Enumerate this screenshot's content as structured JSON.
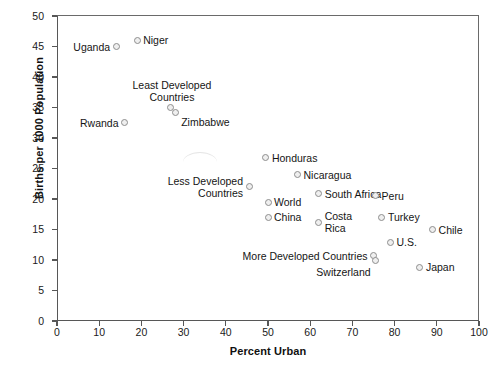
{
  "chart_data": {
    "type": "scatter",
    "title": "",
    "xlabel": "Percent Urban",
    "ylabel": "Births per 1000 Population",
    "xlim": [
      0,
      100
    ],
    "ylim": [
      0,
      50
    ],
    "xticks": [
      0,
      10,
      20,
      30,
      40,
      50,
      60,
      70,
      80,
      90,
      100
    ],
    "yticks": [
      0,
      5,
      10,
      15,
      20,
      25,
      30,
      35,
      40,
      45,
      50
    ],
    "grid": false,
    "legend": "none",
    "points": [
      {
        "label": "Uganda",
        "x": 14,
        "y": 45.0,
        "label_pos": "left"
      },
      {
        "label": "Niger",
        "x": 19,
        "y": 46.0,
        "label_pos": "right"
      },
      {
        "label": "Rwanda",
        "x": 16,
        "y": 32.5,
        "label_pos": "left"
      },
      {
        "label": "Least Developed\nCountries",
        "x": 27,
        "y": 35.0,
        "label_pos": "above"
      },
      {
        "label": "Zimbabwe",
        "x": 28,
        "y": 34.2,
        "label_pos": "below-right"
      },
      {
        "label": "Honduras",
        "x": 49.5,
        "y": 26.8,
        "label_pos": "right"
      },
      {
        "label": "Nicaragua",
        "x": 57,
        "y": 24.0,
        "label_pos": "right"
      },
      {
        "label": "Less Developed\nCountries",
        "x": 45.5,
        "y": 22.0,
        "label_pos": "left"
      },
      {
        "label": "South Africa",
        "x": 62,
        "y": 20.9,
        "label_pos": "right"
      },
      {
        "label": "World",
        "x": 50,
        "y": 19.5,
        "label_pos": "right"
      },
      {
        "label": "Peru",
        "x": 75.5,
        "y": 20.5,
        "label_pos": "right"
      },
      {
        "label": "China",
        "x": 50,
        "y": 17.0,
        "label_pos": "right"
      },
      {
        "label": "Costa\nRica",
        "x": 62,
        "y": 16.2,
        "label_pos": "right"
      },
      {
        "label": "Turkey",
        "x": 77,
        "y": 17.0,
        "label_pos": "right"
      },
      {
        "label": "Chile",
        "x": 89,
        "y": 15.0,
        "label_pos": "right"
      },
      {
        "label": "U.S.",
        "x": 79,
        "y": 12.9,
        "label_pos": "right"
      },
      {
        "label": "More Developed Countries",
        "x": 75,
        "y": 10.7,
        "label_pos": "left"
      },
      {
        "label": "Switzerland",
        "x": 75.5,
        "y": 10.0,
        "label_pos": "below-left"
      },
      {
        "label": "Japan",
        "x": 86,
        "y": 8.8,
        "label_pos": "right"
      }
    ]
  },
  "axes": {
    "y_title": "Births per 1000 Population",
    "x_title": "Percent Urban",
    "y_tick_labels": [
      "0",
      "5",
      "10",
      "15",
      "20",
      "25",
      "30",
      "35",
      "40",
      "45",
      "50"
    ],
    "x_tick_labels": [
      "0",
      "10",
      "20",
      "30",
      "40",
      "50",
      "60",
      "70",
      "80",
      "90",
      "100"
    ]
  },
  "labels": {
    "uganda": "Uganda",
    "niger": "Niger",
    "rwanda": "Rwanda",
    "least_developed": "Least Developed",
    "countries": "Countries",
    "zimbabwe": "Zimbabwe",
    "honduras": "Honduras",
    "nicaragua": "Nicaragua",
    "less_developed": "Less Developed",
    "less_developed_countries": "Countries",
    "south_africa": "South Africa",
    "world": "World",
    "peru": "Peru",
    "china": "China",
    "costa": "Costa",
    "rica": "Rica",
    "turkey": "Turkey",
    "chile": "Chile",
    "us": "U.S.",
    "more_developed": "More Developed Countries",
    "switzerland": "Switzerland",
    "japan": "Japan"
  },
  "colors": {
    "axis": "#575757",
    "marker_stroke": "#8e8e8e",
    "marker_fill": "#efefef",
    "text": "#151515"
  }
}
